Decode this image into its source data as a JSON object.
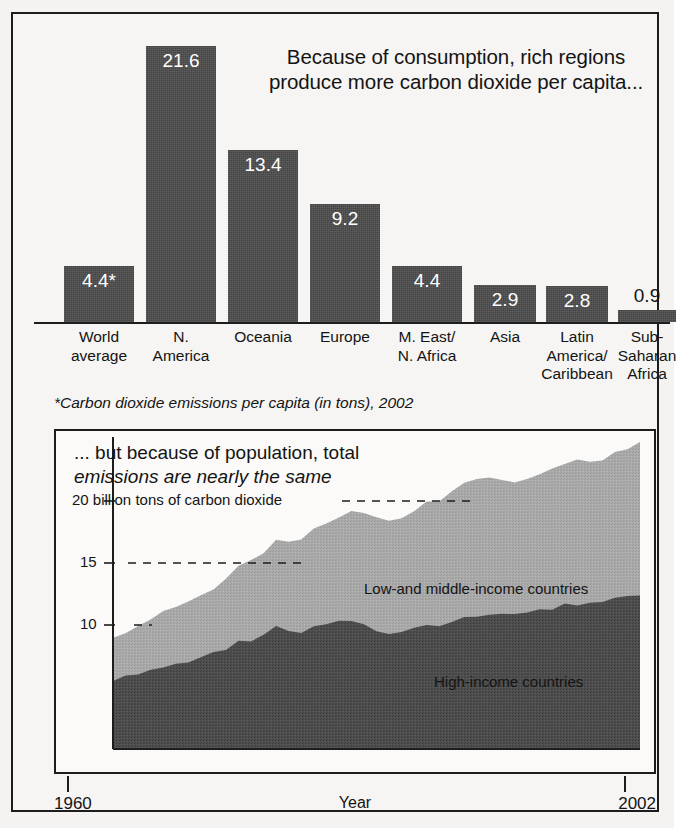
{
  "bar_panel": {
    "title_line1": "Because of consumption, rich regions",
    "title_line2": "produce more carbon dioxide per capita...",
    "footnote": "*Carbon dioxide emissions per capita (in tons), 2002"
  },
  "area_panel": {
    "title_line1": "... but because of population, total",
    "title_line2": "emissions are nearly the same",
    "axis_x_label": "Year",
    "x_start": "1960",
    "x_end": "2002",
    "ytick_20": "20 billion tons of carbon dioxide",
    "ytick_15": "15",
    "ytick_10": "10",
    "legend_upper": "Low-and middle-income countries",
    "legend_lower": "High-income countries"
  },
  "colors": {
    "dark_fill": "#4b4b4b",
    "light_fill": "#a9a9a9",
    "ink": "#1d1d1d",
    "paper": "#f6f5f3"
  },
  "chart_data": [
    {
      "type": "bar",
      "title": "Because of consumption, rich regions produce more carbon dioxide per capita...",
      "subtitle": "*Carbon dioxide emissions per capita (in tons), 2002",
      "xlabel": "",
      "ylabel": "Carbon dioxide emissions per capita (tons)",
      "ylim": [
        0,
        22.5
      ],
      "grid": false,
      "legend": "none",
      "categories": [
        "World average",
        "N. America",
        "Oceania",
        "Europe",
        "M. East/ N. Africa",
        "Asia",
        "Latin America/ Caribbean",
        "Sub- Saharan Africa"
      ],
      "category_lines": [
        [
          "World",
          "average"
        ],
        [
          "N.",
          "America"
        ],
        [
          "Oceania"
        ],
        [
          "Europe"
        ],
        [
          "M. East/",
          "N. Africa"
        ],
        [
          "Asia"
        ],
        [
          "Latin",
          "America/",
          "Caribbean"
        ],
        [
          "Sub-",
          "Saharan",
          "Africa"
        ]
      ],
      "values": [
        4.4,
        21.6,
        13.4,
        9.2,
        4.4,
        2.9,
        2.8,
        0.9
      ],
      "value_labels": [
        "4.4*",
        "21.6",
        "13.4",
        "9.2",
        "4.4",
        "2.9",
        "2.8",
        "0.9"
      ],
      "label_inside": [
        true,
        true,
        true,
        true,
        true,
        true,
        true,
        false
      ]
    },
    {
      "type": "area",
      "stacked": true,
      "title": "... but because of population, total emissions are nearly the same",
      "xlabel": "Year",
      "ylabel": "billion tons of carbon dioxide",
      "xlim": [
        1960,
        2002
      ],
      "ylim": [
        0,
        25
      ],
      "yticks": [
        10,
        15,
        20
      ],
      "ytick_labels": [
        "10",
        "15",
        "20 billion tons of carbon dioxide"
      ],
      "grid": "dashed-partial",
      "legend": "inline-annotation",
      "x": [
        1960,
        1961,
        1962,
        1963,
        1964,
        1965,
        1966,
        1967,
        1968,
        1969,
        1970,
        1971,
        1972,
        1973,
        1974,
        1975,
        1976,
        1977,
        1978,
        1979,
        1980,
        1981,
        1982,
        1983,
        1984,
        1985,
        1986,
        1987,
        1988,
        1989,
        1990,
        1991,
        1992,
        1993,
        1994,
        1995,
        1996,
        1997,
        1998,
        1999,
        2000,
        2001,
        2002
      ],
      "series": [
        {
          "name": "High-income countries",
          "values": [
            5.6,
            5.8,
            6.0,
            6.3,
            6.6,
            6.8,
            7.1,
            7.3,
            7.7,
            8.1,
            8.6,
            8.8,
            9.2,
            9.8,
            9.5,
            9.3,
            9.8,
            10.0,
            10.2,
            10.4,
            10.0,
            9.6,
            9.4,
            9.4,
            9.7,
            9.9,
            10.0,
            10.3,
            10.7,
            10.8,
            10.9,
            10.9,
            10.9,
            11.0,
            11.2,
            11.3,
            11.6,
            11.7,
            11.8,
            11.9,
            12.2,
            12.3,
            12.5
          ]
        },
        {
          "name": "Low-and middle-income countries",
          "values": [
            3.4,
            3.6,
            3.8,
            4.1,
            4.4,
            4.6,
            4.9,
            5.0,
            5.3,
            5.7,
            6.1,
            6.4,
            6.7,
            7.2,
            7.3,
            7.6,
            8.0,
            8.3,
            8.6,
            8.9,
            9.0,
            9.0,
            9.1,
            9.3,
            9.6,
            9.9,
            10.1,
            10.4,
            10.8,
            10.9,
            10.9,
            10.8,
            10.7,
            10.8,
            10.9,
            11.2,
            11.5,
            11.6,
            11.4,
            11.4,
            11.7,
            12.0,
            12.4
          ]
        }
      ],
      "totals": [
        9.0,
        9.4,
        9.8,
        10.4,
        11.0,
        11.4,
        12.0,
        12.3,
        13.0,
        13.8,
        14.7,
        15.2,
        15.9,
        17.0,
        16.8,
        16.9,
        17.8,
        18.3,
        18.8,
        19.3,
        19.0,
        18.6,
        18.5,
        18.7,
        19.3,
        19.8,
        20.1,
        20.7,
        21.5,
        21.7,
        21.8,
        21.7,
        21.6,
        21.8,
        22.1,
        22.5,
        23.1,
        23.3,
        23.2,
        23.3,
        23.9,
        24.3,
        24.9
      ]
    }
  ]
}
